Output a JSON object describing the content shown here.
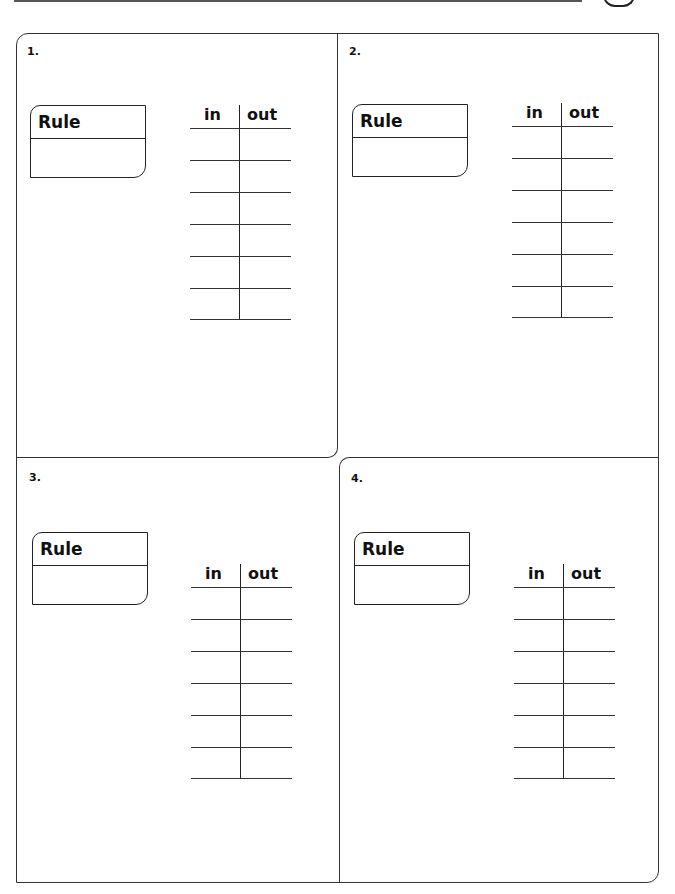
{
  "worksheet": {
    "panels": [
      {
        "number": "1.",
        "rule_label": "Rule",
        "rule_value": "",
        "table": {
          "headers": [
            "in",
            "out"
          ],
          "rows": [
            [
              "",
              ""
            ],
            [
              "",
              ""
            ],
            [
              "",
              ""
            ],
            [
              "",
              ""
            ],
            [
              "",
              ""
            ],
            [
              "",
              ""
            ]
          ]
        }
      },
      {
        "number": "2.",
        "rule_label": "Rule",
        "rule_value": "",
        "table": {
          "headers": [
            "in",
            "out"
          ],
          "rows": [
            [
              "",
              ""
            ],
            [
              "",
              ""
            ],
            [
              "",
              ""
            ],
            [
              "",
              ""
            ],
            [
              "",
              ""
            ],
            [
              "",
              ""
            ]
          ]
        }
      },
      {
        "number": "3.",
        "rule_label": "Rule",
        "rule_value": "",
        "table": {
          "headers": [
            "in",
            "out"
          ],
          "rows": [
            [
              "",
              ""
            ],
            [
              "",
              ""
            ],
            [
              "",
              ""
            ],
            [
              "",
              ""
            ],
            [
              "",
              ""
            ],
            [
              "",
              ""
            ]
          ]
        }
      },
      {
        "number": "4.",
        "rule_label": "Rule",
        "rule_value": "",
        "table": {
          "headers": [
            "in",
            "out"
          ],
          "rows": [
            [
              "",
              ""
            ],
            [
              "",
              ""
            ],
            [
              "",
              ""
            ],
            [
              "",
              ""
            ],
            [
              "",
              ""
            ],
            [
              "",
              ""
            ]
          ]
        }
      }
    ]
  }
}
